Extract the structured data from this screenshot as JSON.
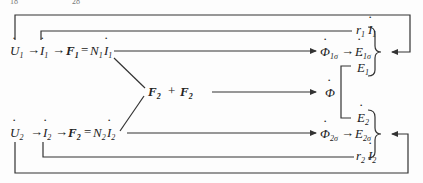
{
  "header_fragment": [
    "18",
    "28"
  ],
  "rows": {
    "row1": {
      "chain": [
        {
          "sym": "U",
          "dot": true,
          "sub": "1"
        },
        {
          "sym": "I",
          "dot": true,
          "sub": "1"
        },
        {
          "sym": "F",
          "bold": true,
          "sub": "1",
          "eq": "= N₁İ₁"
        }
      ],
      "U": "U",
      "U_sub": "1",
      "I": "I",
      "I_sub": "1",
      "F": "F",
      "F_sub": "1",
      "eq_N": "N",
      "eq_N_sub": "1",
      "eq_I": "I",
      "eq_I_sub": "1",
      "flux": "Φ",
      "flux_sub": "1σ",
      "emf": "E",
      "emf_sub": "1σ",
      "res_r": "r",
      "res_r_sub": "1",
      "res_I": "I",
      "res_I_sub": "1",
      "main_emf": "E",
      "main_emf_sub": "1"
    },
    "middle": {
      "mmf_a": "F",
      "mmf_a_sub": "2",
      "plus": "+",
      "mmf_b": "F",
      "mmf_b_sub": "2",
      "flux": "Φ"
    },
    "row2": {
      "U": "U",
      "U_sub": "2",
      "I": "I",
      "I_sub": "2",
      "F": "F",
      "F_sub": "2",
      "eq_N": "N",
      "eq_N_sub": "2",
      "eq_I": "I",
      "eq_I_sub": "2",
      "flux": "Φ",
      "flux_sub": "2σ",
      "emf": "E",
      "emf_sub": "2σ",
      "res_r": "r",
      "res_r_sub": "2",
      "res_I": "I",
      "res_I_sub": "2",
      "main_emf": "E",
      "main_emf_sub": "2"
    }
  },
  "symbols": {
    "arrow": "→",
    "equals": "=",
    "brace": "}"
  }
}
